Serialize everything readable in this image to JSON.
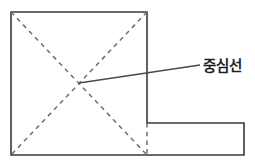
{
  "figure": {
    "background_color": "#ffffff",
    "width": 255,
    "height": 163,
    "colors": {
      "outline_stroke": "#3a3a3a",
      "dashed_stroke": "#6e6e6e",
      "leader_stroke": "#4a4a4a",
      "text_fill": "#1e1e1e"
    },
    "shape": {
      "name": "l-shaped-plate",
      "type": "polygon",
      "description": "L-shaped outline: large square at left with rectangular extension to the lower right",
      "points": "11,12 147,12 147,123 244,123 244,155 11,155",
      "closed": true,
      "vertices": [
        {
          "label": "top-left",
          "x": 11,
          "y": 12
        },
        {
          "label": "top-right-of-square",
          "x": 147,
          "y": 12
        },
        {
          "label": "inner-step-corner",
          "x": 147,
          "y": 123
        },
        {
          "label": "far-right-top",
          "x": 244,
          "y": 123
        },
        {
          "label": "bottom-right",
          "x": 244,
          "y": 155
        },
        {
          "label": "bottom-left",
          "x": 11,
          "y": 155
        }
      ]
    },
    "center_lines": [
      {
        "name": "diagonal-top-left-to-bottom-right",
        "x1": 11,
        "y1": 12,
        "x2": 147,
        "y2": 155
      },
      {
        "name": "diagonal-top-right-to-bottom-left",
        "x1": 147,
        "y1": 12,
        "x2": 11,
        "y2": 155
      },
      {
        "name": "vertical-step-extension",
        "x1": 147,
        "y1": 123,
        "x2": 147,
        "y2": 155
      }
    ],
    "intersection_point": {
      "name": "center-point",
      "x": 79,
      "y": 83
    },
    "leader": {
      "name": "leader-line-to-label",
      "x1": 79,
      "y1": 83,
      "x2": 200,
      "y2": 65
    },
    "label": {
      "text": "중심선",
      "x": 203,
      "y": 71
    }
  }
}
